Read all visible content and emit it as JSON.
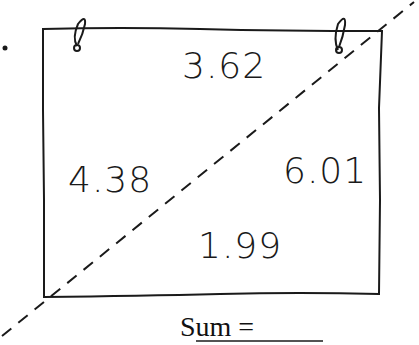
{
  "diagram": {
    "bullet": "•",
    "values": {
      "top": "3.62",
      "left": "4.38",
      "right": "6.01",
      "bottom": "1.99"
    },
    "sum_label": "Sum =",
    "answer_blank": "",
    "colors": {
      "ink": "#1a1a1a",
      "background": "#ffffff"
    }
  }
}
